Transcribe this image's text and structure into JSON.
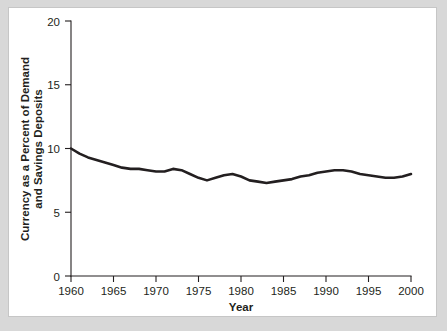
{
  "figure": {
    "background_color": "#d8d8d8",
    "card_color": "#ffffff",
    "border_color": "#c6c6c6",
    "line_color": "#231f20"
  },
  "chart_data": {
    "type": "line",
    "title": "",
    "xlabel": "Year",
    "ylabel": "Currency as a Percent of Demand and Savings Deposits",
    "ylabel_line1": "Currency as a Percent of Demand",
    "ylabel_line2": "and Savings Deposits",
    "xlim": [
      1960,
      2000
    ],
    "ylim": [
      0,
      20
    ],
    "xticks": [
      1960,
      1965,
      1970,
      1975,
      1980,
      1985,
      1990,
      1995,
      2000
    ],
    "xtick_labels": [
      "1960",
      "1965",
      "1970",
      "1975",
      "1980",
      "1985",
      "1990",
      "1995",
      "2000"
    ],
    "yticks": [
      0,
      5,
      10,
      15,
      20
    ],
    "ytick_labels": [
      "0",
      "5",
      "10",
      "15",
      "20"
    ],
    "grid": false,
    "legend": false,
    "series": [
      {
        "name": "Currency as a Percent of Demand and Savings Deposits",
        "color": "#231f20",
        "x": [
          1960,
          1961,
          1962,
          1963,
          1964,
          1965,
          1966,
          1967,
          1968,
          1969,
          1970,
          1971,
          1972,
          1973,
          1974,
          1975,
          1976,
          1977,
          1978,
          1979,
          1980,
          1981,
          1982,
          1983,
          1984,
          1985,
          1986,
          1987,
          1988,
          1989,
          1990,
          1991,
          1992,
          1993,
          1994,
          1995,
          1996,
          1997,
          1998,
          1999,
          2000
        ],
        "values": [
          10.0,
          9.6,
          9.3,
          9.1,
          8.9,
          8.7,
          8.5,
          8.4,
          8.4,
          8.3,
          8.2,
          8.2,
          8.4,
          8.3,
          8.0,
          7.7,
          7.5,
          7.7,
          7.9,
          8.0,
          7.8,
          7.5,
          7.4,
          7.3,
          7.4,
          7.5,
          7.6,
          7.8,
          7.9,
          8.1,
          8.2,
          8.3,
          8.3,
          8.2,
          8.0,
          7.9,
          7.8,
          7.7,
          7.7,
          7.8,
          8.0
        ]
      }
    ]
  }
}
